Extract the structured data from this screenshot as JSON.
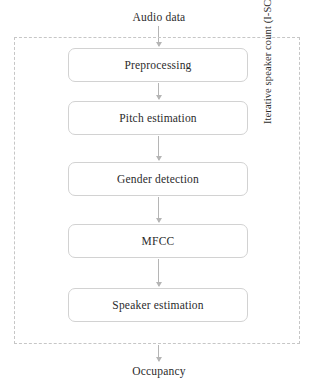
{
  "diagram": {
    "input_label": "Audio data",
    "output_label": "Occupancy",
    "group_caption": "Iterative speaker count (I-SC)",
    "steps": [
      {
        "id": "preprocessing",
        "label": "Preprocessing"
      },
      {
        "id": "pitch-estimation",
        "label": "Pitch estimation"
      },
      {
        "id": "gender-detection",
        "label": "Gender detection"
      },
      {
        "id": "mfcc",
        "label": "MFCC"
      },
      {
        "id": "speaker-estimation",
        "label": "Speaker estimation"
      }
    ],
    "arrows": [
      {
        "id": "input",
        "from": "Audio data",
        "to": "Preprocessing"
      },
      {
        "id": "prep-to-pitch",
        "from": "Preprocessing",
        "to": "Pitch estimation"
      },
      {
        "id": "pitch-to-gender",
        "from": "Pitch estimation",
        "to": "Gender detection"
      },
      {
        "id": "gender-to-mfcc",
        "from": "Gender detection",
        "to": "MFCC"
      },
      {
        "id": "mfcc-to-speaker",
        "from": "MFCC",
        "to": "Speaker estimation"
      },
      {
        "id": "output",
        "from": "Speaker estimation",
        "to": "Occupancy"
      }
    ],
    "colors": {
      "background": "#ffffff",
      "text": "#2b2b2b",
      "box_border": "#d2d2d2",
      "group_border": "#c6c6c6",
      "arrow": "#b5b5b5"
    }
  }
}
